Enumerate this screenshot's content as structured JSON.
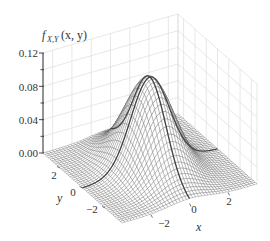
{
  "chart_data": {
    "type": "surface3d",
    "title": "",
    "function": "bivariate normal density f_{X,Y}(x,y)",
    "zlabel": "f_{X,Y}(x, y)",
    "xlabel": "x",
    "ylabel": "y",
    "xlim": [
      -3.5,
      3.5
    ],
    "ylim": [
      -3.5,
      3.5
    ],
    "zlim": [
      0,
      0.12
    ],
    "xticks": [
      -2,
      0,
      2
    ],
    "yticks": [
      -2,
      0,
      2
    ],
    "zticks": [
      0.0,
      0.04,
      0.08,
      0.12
    ],
    "ztick_labels": [
      "0.00",
      "0.04",
      "0.08",
      "0.12"
    ],
    "peak_value": 0.11,
    "peak_location": [
      0,
      0
    ],
    "highlighted_curves": [
      "x = 0 slice",
      "y = 0 slice"
    ],
    "mesh_color": "#555555",
    "grid": true,
    "grid_color": "#dcdcdc"
  },
  "labels": {
    "z_axis_title_main": "f",
    "z_axis_title_sub": "X,Y",
    "z_axis_title_args": "(x, y)",
    "x_axis_title": "x",
    "y_axis_title": "y",
    "xtick_labels": [
      "−2",
      "0",
      "2"
    ],
    "ytick_labels": [
      "−2",
      "0",
      "2"
    ],
    "ztick_labels": [
      "0.00",
      "0.04",
      "0.08",
      "0.12"
    ]
  }
}
